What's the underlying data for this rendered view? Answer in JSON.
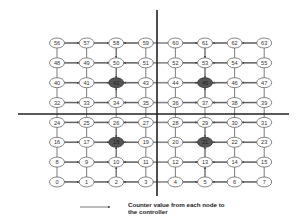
{
  "diagram": {
    "type": "8x8 mesh network with 4 quadrant controllers",
    "grid": {
      "cols": 8,
      "rows": 8,
      "origin_x": 57,
      "origin_y_top": 43,
      "dx": 29.6,
      "dy": 19.85
    },
    "colors": {
      "node_fill": "#ffffff",
      "node_stroke": "#666666",
      "controller_fill": "#555555",
      "link": "#888888",
      "arrow": "#444444",
      "divider": "#222222",
      "text": "#333333"
    },
    "nodes_rows_top_to_bottom": [
      [
        "56",
        "57",
        "58",
        "59",
        "60",
        "61",
        "62",
        "63"
      ],
      [
        "48",
        "49",
        "50",
        "51",
        "52",
        "53",
        "54",
        "55"
      ],
      [
        "40",
        "41",
        "42",
        "43",
        "44",
        "45",
        "46",
        "47"
      ],
      [
        "32",
        "33",
        "34",
        "35",
        "36",
        "37",
        "38",
        "39"
      ],
      [
        "24",
        "25",
        "26",
        "27",
        "28",
        "29",
        "30",
        "31"
      ],
      [
        "16",
        "17",
        "18",
        "19",
        "20",
        "21",
        "22",
        "23"
      ],
      [
        "8",
        "9",
        "10",
        "11",
        "12",
        "13",
        "14",
        "15"
      ],
      [
        "0",
        "1",
        "2",
        "3",
        "4",
        "5",
        "6",
        "7"
      ]
    ],
    "controllers": [
      "18",
      "21",
      "42",
      "45"
    ],
    "quadrants": [
      {
        "name": "bottom-left",
        "nodes": "0-3, 8-11, 16-19, 24-27",
        "controller": "18"
      },
      {
        "name": "bottom-right",
        "nodes": "4-7, 12-15, 20-23, 28-31",
        "controller": "21"
      },
      {
        "name": "top-left",
        "nodes": "32-35, 40-43, 48-51, 56-59",
        "controller": "42"
      },
      {
        "name": "top-right",
        "nodes": "36-39, 44-47, 52-55, 60-63",
        "controller": "45"
      }
    ],
    "dividers": {
      "vertical": {
        "x": 157,
        "y1": 10,
        "y2": 196
      },
      "horizontal": {
        "y": 114,
        "x1": 18,
        "x2": 289
      }
    }
  },
  "legend": {
    "arrow_label_line1": "Counter value from each node to",
    "arrow_label_line2": "the controller",
    "arrow": {
      "x1": 80,
      "x2": 110,
      "y": 207
    }
  }
}
